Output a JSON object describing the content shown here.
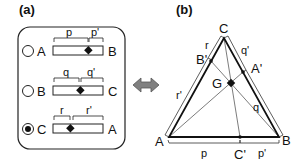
{
  "panel_a": {
    "label": "(a)",
    "rows": [
      {
        "left": "A",
        "right": "B",
        "seg1": "p",
        "seg2": "p'",
        "selected": false,
        "split": 0.7
      },
      {
        "left": "B",
        "right": "C",
        "seg1": "q",
        "seg2": "q'",
        "selected": false,
        "split": 0.53
      },
      {
        "left": "C",
        "right": "A",
        "seg1": "r",
        "seg2": "r'",
        "selected": true,
        "split": 0.33
      }
    ]
  },
  "arrow": {
    "icon": "double-arrow-icon",
    "color": "#808080"
  },
  "panel_b": {
    "label": "(b)",
    "vertices": {
      "A": "A",
      "B": "B",
      "C": "C"
    },
    "points": {
      "A_prime": "A'",
      "B_prime": "B'",
      "C_prime": "C'",
      "G": "G"
    },
    "segments": {
      "p": "p",
      "p_prime": "p'",
      "q": "q",
      "q_prime": "q'",
      "r": "r",
      "r_prime": "r'"
    }
  }
}
